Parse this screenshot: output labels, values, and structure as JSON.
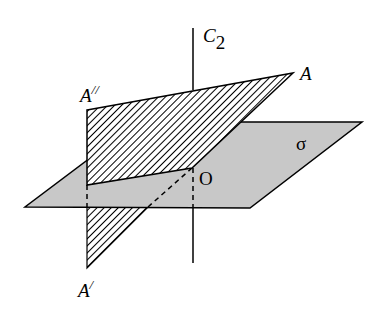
{
  "diagram": {
    "labels": {
      "axis": "C",
      "axis_sub": "2",
      "a": "A",
      "a_double_prime": "A",
      "double_prime": "//",
      "a_prime": "A",
      "prime": "/",
      "origin": "O",
      "sigma": "σ"
    },
    "colors": {
      "plane_sigma_fill": "#c8c8c8",
      "hatch": "#000000",
      "line": "#000000",
      "background": "#ffffff"
    }
  }
}
